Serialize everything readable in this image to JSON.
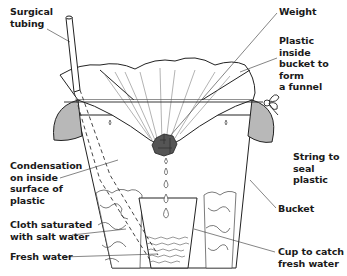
{
  "labels": [
    {
      "id": "surgical-tubing",
      "text": "Surgical\ntubing",
      "x": 10,
      "y": 6
    },
    {
      "id": "weight",
      "text": "Weight",
      "x": 279,
      "y": 6
    },
    {
      "id": "plastic-funnel",
      "text": "Plastic inside\nbucket to form\na funnel",
      "x": 279,
      "y": 35
    },
    {
      "id": "string",
      "text": "String to\nseal plastic",
      "x": 293,
      "y": 151
    },
    {
      "id": "condensation",
      "text": "Condensation\non inside\nsurface of\nplastic",
      "x": 10,
      "y": 160
    },
    {
      "id": "bucket",
      "text": "Bucket",
      "x": 278,
      "y": 203
    },
    {
      "id": "cloth",
      "text": "Cloth saturated\nwith salt water",
      "x": 10,
      "y": 219
    },
    {
      "id": "fresh-water",
      "text": "Fresh water",
      "x": 10,
      "y": 251
    },
    {
      "id": "cup",
      "text": "Cup to catch\nfresh water",
      "x": 278,
      "y": 246
    }
  ],
  "colors": {
    "line": "#222222",
    "shade": "#b8b8b8",
    "weight": "#555555"
  }
}
